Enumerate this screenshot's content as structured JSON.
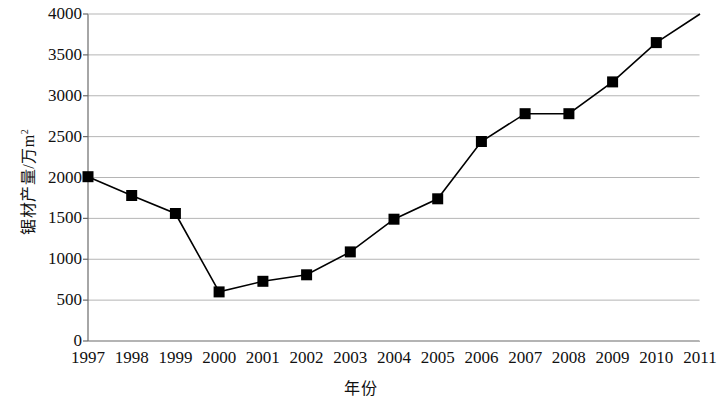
{
  "chart_data": {
    "type": "line",
    "title": "",
    "xlabel": "年份",
    "ylabel": "锯材产量/万m²",
    "ylabel_base": "锯材产量/万m",
    "ylabel_sup": "2",
    "x": [
      1997,
      1998,
      1999,
      2000,
      2001,
      2002,
      2003,
      2004,
      2005,
      2006,
      2007,
      2008,
      2009,
      2010
    ],
    "values": [
      2010,
      1780,
      1560,
      600,
      730,
      810,
      1090,
      1490,
      1740,
      2440,
      2780,
      2780,
      3170,
      3650
    ],
    "categories": [
      "1997",
      "1998",
      "1999",
      "2000",
      "2001",
      "2002",
      "2003",
      "2004",
      "2005",
      "2006",
      "2007",
      "2008",
      "2009",
      "2010"
    ],
    "xtick_labels": [
      "1997",
      "1998",
      "1999",
      "2000",
      "2001",
      "2002",
      "2003",
      "2004",
      "2005",
      "2006",
      "2007",
      "2008",
      "2009",
      "2010",
      "2011"
    ],
    "ytick_labels": [
      "0",
      "500",
      "1000",
      "1500",
      "2000",
      "2500",
      "3000",
      "3500",
      "4000"
    ],
    "ytick_values": [
      0,
      500,
      1000,
      1500,
      2000,
      2500,
      3000,
      3500,
      4000
    ],
    "xlim": [
      1997,
      2011
    ],
    "ylim": [
      0,
      4000
    ],
    "grid": "horizontal",
    "legend": "none",
    "line_extends_to": {
      "x": 2011,
      "y": 4000
    },
    "marker": "filled-square",
    "colors": {
      "line": "#000000",
      "marker": "#000000",
      "grid": "#b5b5b5",
      "axis": "#6b6b6b",
      "background": "#ffffff",
      "text": "#111111"
    }
  }
}
